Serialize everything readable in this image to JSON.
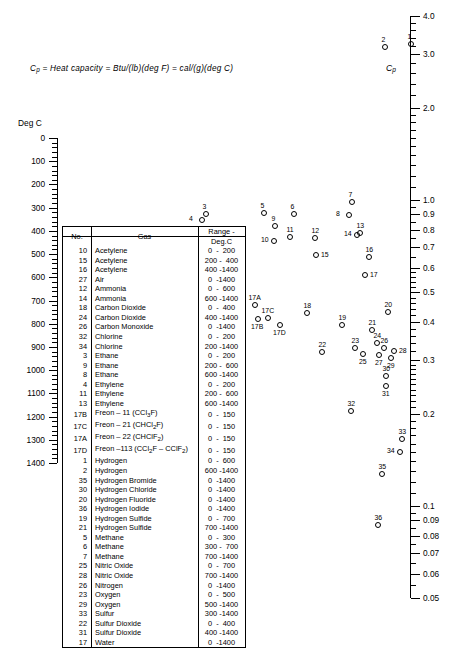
{
  "caption": {
    "text": "Cp = Heat capacity = Btu/(lb)(deg F) = cal/(g)(deg C)",
    "symbol": "C",
    "symbol_sub": "p"
  },
  "left_axis": {
    "title": "Deg C",
    "ticks": [
      "0",
      "100",
      "200",
      "300",
      "400",
      "500",
      "600",
      "700",
      "800",
      "900",
      "1000",
      "1100",
      "1200",
      "1300",
      "1400"
    ],
    "min": 0,
    "max": 1400
  },
  "right_axis": {
    "title": "C",
    "title_sub": "p",
    "ticks": [
      "4.0",
      "3.0",
      "2.0",
      "1.0",
      "0.9",
      "0.8",
      "0.7",
      "0.6",
      "0.5",
      "0.4",
      "0.3",
      "0.2",
      "0.1",
      "0.09",
      "0.08",
      "0.07",
      "0.06",
      "0.05"
    ],
    "min": 0.05,
    "max": 4.0,
    "scale": "log"
  },
  "table": {
    "headers": [
      "No.",
      "Gas",
      "Range - Deg.C"
    ],
    "rows": [
      {
        "no": "10",
        "gas": "Acetylene",
        "range": "0  -  200"
      },
      {
        "no": "15",
        "gas": "Acetylene",
        "range": "200 -  400"
      },
      {
        "no": "16",
        "gas": "Acetylene",
        "range": "400 -1400"
      },
      {
        "no": "27",
        "gas": "Air",
        "range": "0  -1400"
      },
      {
        "no": "12",
        "gas": "Ammonia",
        "range": "0  -  600"
      },
      {
        "no": "14",
        "gas": "Ammonia",
        "range": "600 -1400"
      },
      {
        "no": "18",
        "gas": "Carbon Dioxide",
        "range": "0  -  400"
      },
      {
        "no": "24",
        "gas": "Carbon Dioxide",
        "range": "400 -1400"
      },
      {
        "no": "26",
        "gas": "Carbon Monoxide",
        "range": "0  -1400"
      },
      {
        "no": "32",
        "gas": "Chlorine",
        "range": "0  -  200"
      },
      {
        "no": "34",
        "gas": "Chlorine",
        "range": "200 -1400"
      },
      {
        "no": "3",
        "gas": "Ethane",
        "range": "0  -  200"
      },
      {
        "no": "9",
        "gas": "Ethane",
        "range": "200 -  600"
      },
      {
        "no": "8",
        "gas": "Ethane",
        "range": "600 -1400"
      },
      {
        "no": "4",
        "gas": "Ethylene",
        "range": "0  -  200"
      },
      {
        "no": "11",
        "gas": "Ethylene",
        "range": "200 -  600"
      },
      {
        "no": "13",
        "gas": "Ethylene",
        "range": "600 -1400"
      },
      {
        "no": "17B",
        "gas": "Freon - 11 (CCl3F)",
        "gas_html": "Freon – 11 (CCl<sub>3</sub>F)",
        "range": "0  -  150"
      },
      {
        "no": "17C",
        "gas": "Freon - 21 (CHCl2F)",
        "gas_html": "Freon – 21 (CHCl<sub>2</sub>F)",
        "range": "0  -  150"
      },
      {
        "no": "17A",
        "gas": "Freon - 22 (CHClF2)",
        "gas_html": "Freon – 22 (CHClF<sub>2</sub>)",
        "range": "0  -  150"
      },
      {
        "no": "17D",
        "gas": "Freon -113 (CCl2F - CClF2)",
        "gas_html": "Freon –113 (CCl<sub>2</sub>F – CClF<sub>2</sub>)",
        "range": "0  -  150"
      },
      {
        "no": "1",
        "gas": "Hydrogen",
        "range": "0  -  600"
      },
      {
        "no": "2",
        "gas": "Hydrogen",
        "range": "600 -1400"
      },
      {
        "no": "35",
        "gas": "Hydrogen Bromide",
        "range": "0  -1400"
      },
      {
        "no": "30",
        "gas": "Hydrogen Chloride",
        "range": "0  -1400"
      },
      {
        "no": "20",
        "gas": "Hydrogen Fluoride",
        "range": "0  -1400"
      },
      {
        "no": "36",
        "gas": "Hydrogen Iodide",
        "range": "0  -1400"
      },
      {
        "no": "19",
        "gas": "Hydrogen Sulfide",
        "range": "0  -  700"
      },
      {
        "no": "21",
        "gas": "Hydrogen Sulfide",
        "range": "700 -1400"
      },
      {
        "no": "5",
        "gas": "Methane",
        "range": "0  -  300"
      },
      {
        "no": "6",
        "gas": "Methane",
        "range": "300 -  700"
      },
      {
        "no": "7",
        "gas": "Methane",
        "range": "700 -1400"
      },
      {
        "no": "25",
        "gas": "Nitric Oxide",
        "range": "0  -  700"
      },
      {
        "no": "28",
        "gas": "Nitric Oxide",
        "range": "700 -1400"
      },
      {
        "no": "26",
        "gas": "Nitrogen",
        "range": "0  -1400"
      },
      {
        "no": "23",
        "gas": "Oxygen",
        "range": "0  -  500"
      },
      {
        "no": "29",
        "gas": "Oxygen",
        "range": "500 -1400"
      },
      {
        "no": "33",
        "gas": "Sulfur",
        "range": "300 -1400"
      },
      {
        "no": "22",
        "gas": "Sulfur Dioxide",
        "range": "0  -  400"
      },
      {
        "no": "31",
        "gas": "Sulfur Dioxide",
        "range": "400 -1400"
      },
      {
        "no": "17",
        "gas": "Water",
        "range": "0  -1400"
      }
    ]
  },
  "chart_data": {
    "type": "scatter",
    "xlabel": "",
    "ylabel": "",
    "note": "Index points positioned on an alignment-chart grid; x,y are pixel positions in the 461x651 figure.",
    "points": [
      {
        "id": "1",
        "x": 411,
        "y": 44,
        "label_pos": "above"
      },
      {
        "id": "2",
        "x": 385,
        "y": 47,
        "label_pos": "above"
      },
      {
        "id": "3",
        "x": 206,
        "y": 214,
        "label_pos": "above"
      },
      {
        "id": "4",
        "x": 202,
        "y": 220,
        "label_pos": "left"
      },
      {
        "id": "5",
        "x": 264,
        "y": 213,
        "label_pos": "above"
      },
      {
        "id": "6",
        "x": 294,
        "y": 214,
        "label_pos": "above"
      },
      {
        "id": "7",
        "x": 352,
        "y": 202,
        "label_pos": "above"
      },
      {
        "id": "8",
        "x": 349,
        "y": 215,
        "label_pos": "left"
      },
      {
        "id": "9",
        "x": 275,
        "y": 226,
        "label_pos": "above"
      },
      {
        "id": "10",
        "x": 274,
        "y": 241,
        "label_pos": "left"
      },
      {
        "id": "11",
        "x": 290,
        "y": 237,
        "label_pos": "above"
      },
      {
        "id": "12",
        "x": 315,
        "y": 238,
        "label_pos": "above"
      },
      {
        "id": "13",
        "x": 360,
        "y": 233,
        "label_pos": "above"
      },
      {
        "id": "14",
        "x": 357,
        "y": 235,
        "label_pos": "left"
      },
      {
        "id": "15",
        "x": 316,
        "y": 255,
        "label_pos": "right"
      },
      {
        "id": "16",
        "x": 369,
        "y": 257,
        "label_pos": "above"
      },
      {
        "id": "17",
        "x": 365,
        "y": 275,
        "label_pos": "right"
      },
      {
        "id": "17A",
        "x": 255,
        "y": 305,
        "label_pos": "above"
      },
      {
        "id": "17B",
        "x": 258,
        "y": 319,
        "label_pos": "below"
      },
      {
        "id": "17C",
        "x": 268,
        "y": 318,
        "label_pos": "above"
      },
      {
        "id": "17D",
        "x": 280,
        "y": 325,
        "label_pos": "below"
      },
      {
        "id": "18",
        "x": 307,
        "y": 313,
        "label_pos": "above"
      },
      {
        "id": "19",
        "x": 342,
        "y": 325,
        "label_pos": "above"
      },
      {
        "id": "20",
        "x": 388,
        "y": 312,
        "label_pos": "above"
      },
      {
        "id": "21",
        "x": 372,
        "y": 330,
        "label_pos": "above"
      },
      {
        "id": "22",
        "x": 322,
        "y": 352,
        "label_pos": "above"
      },
      {
        "id": "23",
        "x": 355,
        "y": 348,
        "label_pos": "above"
      },
      {
        "id": "24",
        "x": 377,
        "y": 343,
        "label_pos": "above"
      },
      {
        "id": "25",
        "x": 363,
        "y": 354,
        "label_pos": "below"
      },
      {
        "id": "26",
        "x": 384,
        "y": 348,
        "label_pos": "above"
      },
      {
        "id": "27",
        "x": 379,
        "y": 355,
        "label_pos": "below"
      },
      {
        "id": "28",
        "x": 394,
        "y": 351,
        "label_pos": "right"
      },
      {
        "id": "29",
        "x": 391,
        "y": 358,
        "label_pos": "below"
      },
      {
        "id": "30",
        "x": 386,
        "y": 376,
        "label_pos": "above"
      },
      {
        "id": "31",
        "x": 386,
        "y": 386,
        "label_pos": "below"
      },
      {
        "id": "32",
        "x": 351,
        "y": 411,
        "label_pos": "above"
      },
      {
        "id": "33",
        "x": 402,
        "y": 439,
        "label_pos": "above"
      },
      {
        "id": "34",
        "x": 400,
        "y": 452,
        "label_pos": "left"
      },
      {
        "id": "35",
        "x": 382,
        "y": 474,
        "label_pos": "above"
      },
      {
        "id": "36",
        "x": 378,
        "y": 525,
        "label_pos": "above"
      }
    ]
  }
}
